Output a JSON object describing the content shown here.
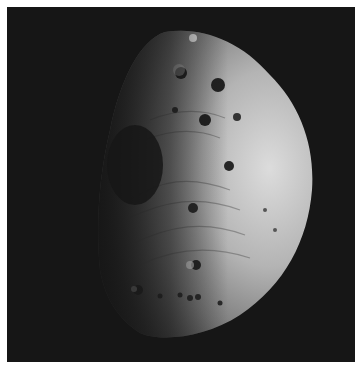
{
  "image": {
    "subject": "cratered asteroid (Vesta-like) partially lit against black space",
    "style": "grayscale photograph",
    "colors": {
      "border": "#ffffff",
      "space": "#161616",
      "surface_light": "#d8d8d8",
      "surface_mid": "#8a8a8a",
      "surface_shadow": "#2a2a2a",
      "crater_dark": "#1e1e1e"
    }
  }
}
